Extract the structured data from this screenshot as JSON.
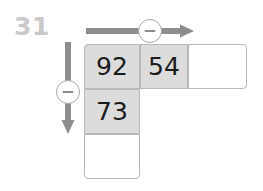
{
  "problem": {
    "number": "31",
    "number_color": "#c9c9c9"
  },
  "operators": {
    "horizontal": {
      "symbol": "−",
      "icon": "minus-circle-icon",
      "direction": "right"
    },
    "vertical": {
      "symbol": "−",
      "icon": "minus-circle-icon",
      "direction": "down"
    }
  },
  "colors": {
    "cell_filled": "#dcdcdc",
    "cell_empty": "#ffffff",
    "cell_border": "#b9b9b9",
    "arrow": "#8d8d8d",
    "text": "#1b1b1b"
  },
  "grid": {
    "row": {
      "cells": [
        {
          "value": "92",
          "state": "filled"
        },
        {
          "value": "54",
          "state": "filled"
        },
        {
          "value": "",
          "state": "empty"
        }
      ]
    },
    "column": {
      "cells": [
        {
          "value": "92",
          "state": "filled"
        },
        {
          "value": "73",
          "state": "filled"
        },
        {
          "value": "",
          "state": "empty"
        }
      ]
    }
  }
}
